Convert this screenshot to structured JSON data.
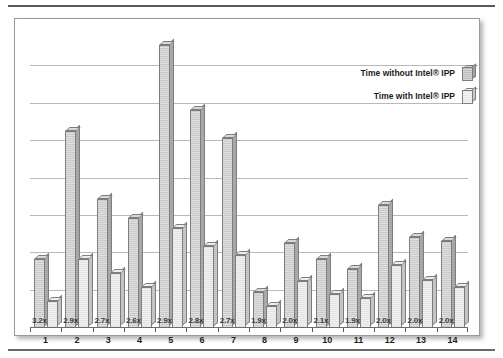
{
  "chart_data": {
    "type": "bar",
    "title": "",
    "subtitle": "",
    "xlabel": "",
    "ylabel": "",
    "grid": true,
    "legend_position": "top-right",
    "categories": [
      "1",
      "2",
      "3",
      "4",
      "5",
      "6",
      "7",
      "8",
      "9",
      "10",
      "11",
      "12",
      "13",
      "14"
    ],
    "series": [
      {
        "name": "Time without Intel® IPP",
        "values": [
          64,
          182,
          119,
          101,
          261,
          201,
          175,
          33,
          78,
          64,
          54,
          113,
          84,
          80
        ]
      },
      {
        "name": "Time with Intel® IPP",
        "values": [
          25,
          64,
          51,
          38,
          92,
          76,
          67,
          20,
          43,
          31,
          28,
          58,
          44,
          38
        ]
      }
    ],
    "annotations": {
      "label": "speedup",
      "values": [
        "3.2x",
        "2.9x",
        "2.7x",
        "2.6x",
        "2.9x",
        "2.8x",
        "2.7x",
        "1.9x",
        "2.0x",
        "2.1x",
        "1.9x",
        "2.0x",
        "2.0x",
        "2.0x"
      ]
    },
    "ylim": [
      0,
      270
    ],
    "gridline_count": 7,
    "colors": {
      "series_without": "#c9c9c9",
      "series_with": "#e8e8e8",
      "outline": "#7d7d7d",
      "grid": "#b9b9b9",
      "axis": "#6b6b6b",
      "text": "#1f1f1f"
    }
  },
  "legend": {
    "items": [
      {
        "label": "Time without Intel® IPP",
        "swatch": "dark"
      },
      {
        "label": "Time with Intel® IPP",
        "swatch": "light"
      }
    ]
  }
}
